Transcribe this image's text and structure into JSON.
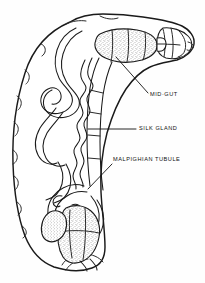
{
  "figure": {
    "style": "black ink line drawing with stippled shading on white background",
    "background_color": "#ffffff",
    "ink_color": "#1a1a1a",
    "orientation": "head at upper right, abdomen curving to lower left"
  },
  "labels": [
    {
      "id": "mid-gut",
      "text": "MID·GUT",
      "text_x": 150,
      "text_y": 95,
      "leader": "M 148 93 L 116 57",
      "points_to": "stippled tubular midgut in thorax/anterior abdomen"
    },
    {
      "id": "silk-gland",
      "text": "SILK GLAND",
      "text_x": 139,
      "text_y": 129,
      "leader": "M 136 129 L 88 129",
      "points_to": "crimped zigzag silk gland tube"
    },
    {
      "id": "malpighian-tubule",
      "text": "MALPIGHIAN TUBULE",
      "text_x": 113,
      "text_y": 160,
      "leader": "M 112 164 L 88 189",
      "points_to": "looping malpighian tubules in posterior abdomen"
    }
  ],
  "structures": [
    {
      "id": "body-wall",
      "name": "body wall outline",
      "shading": "none"
    },
    {
      "id": "mid-gut",
      "name": "mid gut",
      "shading": "stippled"
    },
    {
      "id": "silk-gland",
      "name": "silk gland",
      "shading": "outline only"
    },
    {
      "id": "malpighian-tubule",
      "name": "malpighian tubule",
      "shading": "outline only"
    },
    {
      "id": "hind-gut",
      "name": "hind gut",
      "shading": "stippled"
    },
    {
      "id": "head-capsule",
      "name": "head capsule",
      "shading": "outline only"
    }
  ]
}
